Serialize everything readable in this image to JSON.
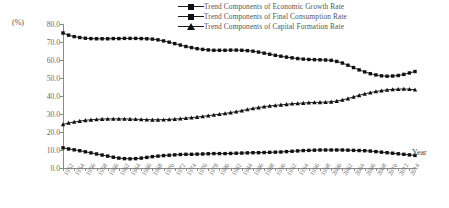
{
  "unit_label": "(%)",
  "x_axis_title": "Year",
  "legend": [
    {
      "label": "Trend Components of Economic Growth Rate",
      "marker": "square",
      "color": "#111111"
    },
    {
      "label": "Trend Components of Final Consumption Rate",
      "marker": "square",
      "color": "#111111"
    },
    {
      "label": "Trend Components of Capital Formation Rate",
      "marker": "triangle",
      "color": "#111111"
    }
  ],
  "chart_data": {
    "type": "line",
    "title": "",
    "xlabel": "Year",
    "ylabel": "(%)",
    "ylim": [
      0,
      80
    ],
    "yticks": [
      0,
      10,
      20,
      30,
      40,
      50,
      60,
      70,
      80
    ],
    "ytick_labels": [
      "0.0",
      "10.0",
      "20.0",
      "30.0",
      "40.0",
      "50.0",
      "60.0",
      "70.0",
      "80.0"
    ],
    "grid": false,
    "legend_position": "top-right",
    "x": [
      1952,
      1953,
      1954,
      1955,
      1956,
      1957,
      1958,
      1959,
      1960,
      1961,
      1962,
      1963,
      1964,
      1965,
      1966,
      1967,
      1968,
      1969,
      1970,
      1971,
      1972,
      1973,
      1974,
      1975,
      1976,
      1977,
      1978,
      1979,
      1980,
      1981,
      1982,
      1983,
      1984,
      1985,
      1986,
      1987,
      1988,
      1989,
      1990,
      1991,
      1992,
      1993,
      1994,
      1995,
      1996,
      1997,
      1998,
      1999,
      2000,
      2001,
      2002,
      2003,
      2004,
      2005,
      2006,
      2007,
      2008,
      2009,
      2010,
      2011,
      2012,
      2013,
      2014,
      2015
    ],
    "xtick_labels": [
      "1952",
      "1954",
      "1956",
      "1958",
      "1960",
      "1962",
      "1964",
      "1966",
      "1968",
      "1970",
      "1972",
      "1974",
      "1976",
      "1978",
      "1980",
      "1982",
      "1984",
      "1986",
      "1988",
      "1990",
      "1992",
      "1994",
      "1996",
      "1998",
      "2000",
      "2002",
      "2004",
      "2006",
      "2008",
      "2010",
      "2012",
      "2014"
    ],
    "xtick_step": 2,
    "series": [
      {
        "name": "Trend Components of Economic Growth Rate",
        "marker": "square",
        "color": "#111111",
        "values": [
          11.2,
          10.6,
          10.1,
          9.6,
          9.0,
          8.4,
          7.8,
          7.2,
          6.6,
          6.0,
          5.5,
          5.2,
          5.1,
          5.2,
          5.5,
          5.9,
          6.3,
          6.6,
          6.9,
          7.1,
          7.3,
          7.5,
          7.6,
          7.6,
          7.7,
          7.8,
          7.9,
          8.0,
          8.0,
          8.0,
          8.1,
          8.2,
          8.3,
          8.4,
          8.5,
          8.5,
          8.6,
          8.7,
          8.8,
          8.9,
          9.1,
          9.3,
          9.5,
          9.7,
          9.8,
          9.9,
          10.0,
          10.0,
          10.0,
          10.0,
          10.0,
          9.9,
          9.8,
          9.7,
          9.6,
          9.4,
          9.1,
          8.8,
          8.5,
          8.2,
          7.9,
          7.6,
          7.3,
          7.0
        ]
      },
      {
        "name": "Trend Components of Final Consumption Rate",
        "marker": "square",
        "color": "#111111",
        "values": [
          75.0,
          73.8,
          73.0,
          72.5,
          72.1,
          71.9,
          71.8,
          71.8,
          71.8,
          71.9,
          71.9,
          72.0,
          72.0,
          72.0,
          71.9,
          71.8,
          71.6,
          71.2,
          70.6,
          69.9,
          69.1,
          68.3,
          67.5,
          66.9,
          66.3,
          65.9,
          65.6,
          65.4,
          65.4,
          65.4,
          65.5,
          65.5,
          65.4,
          65.2,
          64.9,
          64.4,
          63.8,
          63.2,
          62.6,
          62.1,
          61.6,
          61.2,
          60.8,
          60.5,
          60.3,
          60.2,
          60.1,
          60.0,
          59.8,
          59.2,
          58.3,
          57.1,
          55.8,
          54.5,
          53.4,
          52.4,
          51.7,
          51.2,
          51.0,
          51.1,
          51.4,
          52.0,
          52.8,
          53.6
        ]
      },
      {
        "name": "Trend Components of Capital Formation Rate",
        "marker": "triangle",
        "color": "#111111",
        "values": [
          24.2,
          25.0,
          25.6,
          26.1,
          26.5,
          26.8,
          27.0,
          27.2,
          27.3,
          27.3,
          27.3,
          27.3,
          27.2,
          27.1,
          27.0,
          26.9,
          26.8,
          26.8,
          26.9,
          27.0,
          27.2,
          27.4,
          27.7,
          28.0,
          28.3,
          28.7,
          29.1,
          29.5,
          29.9,
          30.3,
          30.8,
          31.3,
          31.9,
          32.5,
          33.1,
          33.6,
          34.1,
          34.5,
          34.8,
          35.1,
          35.4,
          35.7,
          35.9,
          36.1,
          36.3,
          36.4,
          36.5,
          36.6,
          36.8,
          37.2,
          37.8,
          38.6,
          39.5,
          40.4,
          41.2,
          41.9,
          42.5,
          43.0,
          43.4,
          43.7,
          43.8,
          43.9,
          43.8,
          43.5
        ]
      }
    ]
  }
}
